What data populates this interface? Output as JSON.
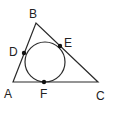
{
  "diagram": {
    "type": "triangle-with-incircle",
    "colors": {
      "stroke": "#2a2a2a",
      "point": "#111111",
      "background": "#ffffff"
    },
    "vertices": [
      {
        "id": "A",
        "label": "A",
        "x": 13,
        "y": 82
      },
      {
        "id": "B",
        "label": "B",
        "x": 36,
        "y": 23
      },
      {
        "id": "C",
        "label": "C",
        "x": 98,
        "y": 82
      }
    ],
    "incircle": {
      "cx": 45,
      "cy": 62,
      "r": 20
    },
    "tangent_points": [
      {
        "id": "D",
        "label": "D",
        "x": 24,
        "y": 53,
        "on_side": "AB"
      },
      {
        "id": "E",
        "label": "E",
        "x": 60,
        "y": 46,
        "on_side": "BC"
      },
      {
        "id": "F",
        "label": "F",
        "x": 44,
        "y": 82,
        "on_side": "AC"
      }
    ],
    "labels": {
      "A": "A",
      "B": "B",
      "C": "C",
      "D": "D",
      "E": "E",
      "F": "F"
    }
  }
}
